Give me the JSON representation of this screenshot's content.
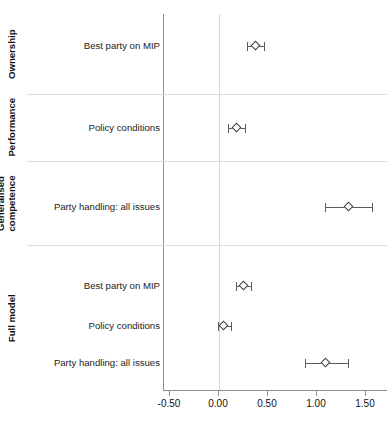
{
  "page_header": {
    "left_text": "",
    "right_text": ""
  },
  "chart_data": {
    "type": "scatter",
    "title": "",
    "subtitle": "",
    "xlabel": "",
    "ylabel": "",
    "xlim": [
      -0.75,
      1.75
    ],
    "xticks": [
      -0.5,
      0.0,
      0.5,
      1.0,
      1.5
    ],
    "xtick_labels": [
      "-0.50",
      "0.00",
      "0.50",
      "1.00",
      "1.50"
    ],
    "grid": false,
    "legend": "none",
    "reference_line": 0.0,
    "marker": "diamond-open",
    "error_bars": "95% confidence interval",
    "groups": [
      {
        "name": "Ownership",
        "label_lines": [
          "Ownership"
        ],
        "points": [
          {
            "label": "Best party on MIP",
            "estimate": 0.38,
            "ci_low": 0.3,
            "ci_high": 0.47
          }
        ]
      },
      {
        "name": "Performance",
        "label_lines": [
          "Performance"
        ],
        "points": [
          {
            "label": "Policy conditions",
            "estimate": 0.19,
            "ci_low": 0.1,
            "ci_high": 0.28
          }
        ]
      },
      {
        "name": "Generalised competence",
        "label_lines": [
          "Generalised",
          "competence"
        ],
        "points": [
          {
            "label": "Party handling: all issues",
            "estimate": 1.33,
            "ci_low": 1.09,
            "ci_high": 1.57
          }
        ]
      },
      {
        "name": "Full model",
        "label_lines": [
          "Full model"
        ],
        "points": [
          {
            "label": "Best party on MIP",
            "estimate": 0.26,
            "ci_low": 0.18,
            "ci_high": 0.34
          },
          {
            "label": "Policy conditions",
            "estimate": 0.06,
            "ci_low": 0.0,
            "ci_high": 0.13
          },
          {
            "label": "Party handling: all issues",
            "estimate": 1.1,
            "ci_low": 0.89,
            "ci_high": 1.33
          }
        ]
      }
    ],
    "colors": {
      "marker_edge": "#3c3c40",
      "marker_face": "#ffffff",
      "error_bar": "#5b5b60",
      "axis": "#8f8f93",
      "reference_line": "#d7d7db",
      "separator": "#dcdcdf",
      "text": "#111111"
    }
  }
}
